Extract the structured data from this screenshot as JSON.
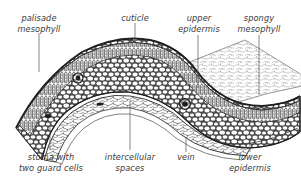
{
  "diagram": {
    "colors": {
      "ink": "#2b2b2b",
      "label_text": "#3a3a3a",
      "leader_line": "#555555",
      "background": "#ffffff"
    },
    "labels": {
      "palisade_mesophyll": {
        "line1": "palisade",
        "line2": "mesophyll"
      },
      "cuticle": {
        "line1": "cuticle"
      },
      "upper_epidermis": {
        "line1": "upper",
        "line2": "epidermis"
      },
      "spongy_mesophyll": {
        "line1": "spongy",
        "line2": "mesophyll"
      },
      "stoma": {
        "line1": "stoma with",
        "line2": "two guard cells"
      },
      "intercellular_spaces": {
        "line1": "intercellular",
        "line2": "spaces"
      },
      "vein": {
        "line1": "vein"
      },
      "lower_epidermis": {
        "line1": "lower",
        "line2": "epidermis"
      }
    }
  }
}
